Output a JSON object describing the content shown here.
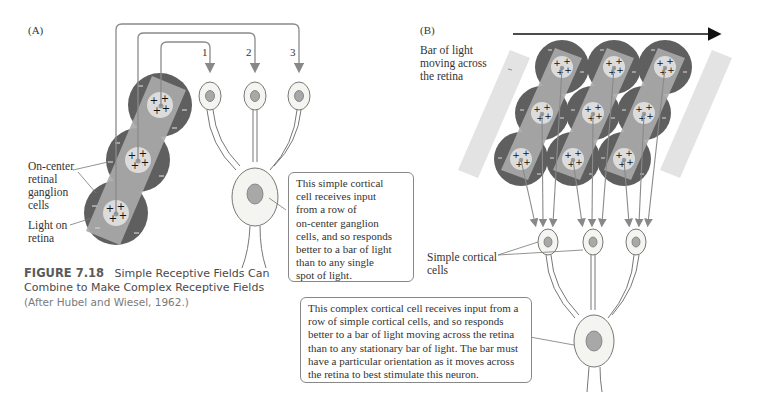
{
  "figure": {
    "number": "FIGURE 7.18",
    "title_line1": "Simple Receptive Fields Can",
    "title_line2": "Combine to Make Complex Receptive Fields",
    "credit": "(After Hubel and Wiesel, 1962.)"
  },
  "panel_a": {
    "tag": "(A)",
    "input_numbers": [
      "1",
      "2",
      "3"
    ],
    "label_ganglion": [
      "On-center",
      "retinal",
      "ganglion",
      "cells"
    ],
    "label_light": [
      "Light on",
      "retina"
    ],
    "callout": "This simple cortical cell receives input from a row of on-center ganglion cells, and so responds better to a bar of light than to any single spot of light.",
    "callout_lines": [
      "This simple cortical",
      "cell receives input",
      "from a row of",
      "on-center ganglion",
      "cells, and so responds",
      "better to a bar of light",
      "than to any single",
      "spot of light."
    ]
  },
  "panel_b": {
    "tag": "(B)",
    "label_bar": [
      "Bar of light",
      "moving across",
      "the retina"
    ],
    "label_simple": [
      "Simple cortical",
      "cells"
    ],
    "callout_lines": [
      "This complex cortical cell receives input from a",
      "row of simple cortical cells, and so responds",
      "better to a bar of light moving across the retina",
      "than to any stationary bar of light. The bar must",
      "have a particular orientation as it moves across",
      "the retina to best stimulate this neuron."
    ]
  },
  "colors": {
    "surround": "#5f5f5f",
    "center": "#d9d9d9",
    "light_bar": "#a9a9a9",
    "bar_ghost": "#e3e3e3",
    "neuron_fill": "#f4f4f0",
    "nucleus": "#a8a8a8",
    "line": "#8a8a8a"
  }
}
